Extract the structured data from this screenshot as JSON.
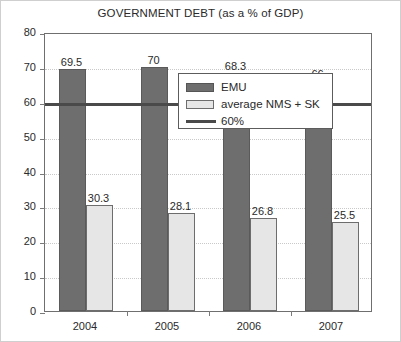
{
  "chart_data": {
    "type": "bar",
    "title": "GOVERNMENT DEBT (as a % of GDP)",
    "xlabel": "",
    "ylabel": "",
    "categories": [
      "2004",
      "2005",
      "2006",
      "2007"
    ],
    "series": [
      {
        "name": "EMU",
        "values": [
          69.5,
          70,
          68.3,
          66
        ],
        "color": "#6e6e6e"
      },
      {
        "name": "average NMS + SK",
        "values": [
          30.3,
          28.1,
          26.8,
          25.5
        ],
        "color": "#e6e6e6"
      }
    ],
    "reference_line": {
      "name": "60%",
      "value": 60,
      "color": "#4a4a4a"
    },
    "ylim": [
      0,
      80
    ],
    "y_ticks": [
      0,
      10,
      20,
      30,
      40,
      50,
      60,
      70,
      80
    ],
    "y_tick_labels": [
      "0",
      "10",
      "20",
      "30",
      "40",
      "50",
      "60",
      "70",
      "80"
    ],
    "grid": true,
    "legend_position": "center-right",
    "data_labels": {
      "EMU": [
        "69.5",
        "70",
        "68.3",
        "66"
      ],
      "average NMS + SK": [
        "30.3",
        "28.1",
        "26.8",
        "25.5"
      ]
    }
  },
  "legend": {
    "entries": [
      {
        "label": "EMU",
        "swatch": "dark-bar-swatch"
      },
      {
        "label": "average NMS + SK",
        "swatch": "light-bar-swatch"
      },
      {
        "label": "60%",
        "swatch": "threshold-line-swatch"
      }
    ]
  }
}
